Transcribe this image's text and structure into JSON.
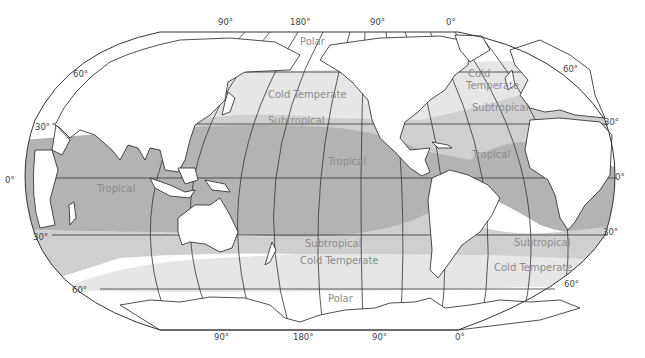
{
  "map": {
    "projection": "Robinson (Pacific-centered)",
    "colors": {
      "background": "#ffffff",
      "land": "#ffffff",
      "polar": "#ffffff",
      "cold_temperate": "#e6e6e6",
      "subtropical": "#cfcfcf",
      "tropical": "#b3b3b3",
      "zone_label": "#8c8c8c",
      "grid": "#333333",
      "coastline": "#222222"
    },
    "zones": [
      {
        "id": "polar-north",
        "label": "Polar"
      },
      {
        "id": "cold-temperate-north-pacific",
        "label": "Cold Temperate"
      },
      {
        "id": "subtropical-north-pacific",
        "label": "Subtropical"
      },
      {
        "id": "tropical-pacific",
        "label": "Tropical"
      },
      {
        "id": "cold-temperate-north-atlantic",
        "label": "Cold Temperate"
      },
      {
        "id": "subtropical-north-atlantic",
        "label": "Subtropical"
      },
      {
        "id": "tropical-atlantic",
        "label": "Tropical"
      },
      {
        "id": "tropical-indian",
        "label": "Tropical"
      },
      {
        "id": "subtropical-south-pacific",
        "label": "Subtropical"
      },
      {
        "id": "cold-temperate-south-pacific",
        "label": "Cold Temperate"
      },
      {
        "id": "subtropical-south-atlantic",
        "label": "Subtropical"
      },
      {
        "id": "cold-temperate-south-atlantic",
        "label": "Cold Temperate"
      },
      {
        "id": "polar-south",
        "label": "Polar"
      }
    ],
    "top_longitude_labels": [
      "90°",
      "180°",
      "90°",
      "0°"
    ],
    "bottom_longitude_labels": [
      "90°",
      "180°",
      "90°",
      "0°"
    ],
    "left_latitude_labels": [
      "60°",
      "30°",
      "0°",
      "30°",
      "60°"
    ],
    "right_latitude_labels": [
      "60°",
      "30°",
      "0°",
      "30°",
      "60°"
    ]
  }
}
